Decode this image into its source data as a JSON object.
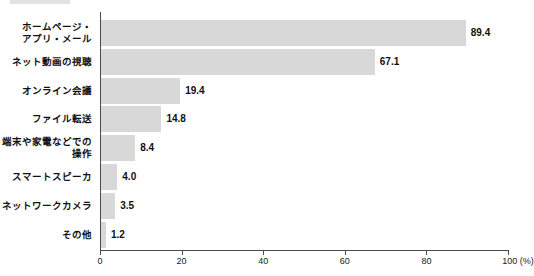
{
  "chart_data": {
    "type": "bar",
    "orientation": "horizontal",
    "title": "",
    "xlabel": "100 (%)",
    "ylabel": "",
    "xlim": [
      0,
      100
    ],
    "grid": false,
    "legend": null,
    "bar_color": "#d8d8d8",
    "axis_color": "#4a4a4a",
    "categories": [
      "ホームページ・\nアプリ・メール",
      "ネット動画の視聴",
      "オンライン会議",
      "ファイル転送",
      "端末や家電などでの\n操作",
      "スマートスピーカ",
      "ネットワークカメラ",
      "その他"
    ],
    "values": [
      89.4,
      67.1,
      19.4,
      14.8,
      8.4,
      4.0,
      3.5,
      1.2
    ],
    "value_labels": [
      "89.4",
      "67.1",
      "19.4",
      "14.8",
      "8.4",
      "4.0",
      "3.5",
      "1.2"
    ],
    "xticks": [
      0,
      20,
      40,
      60,
      80,
      100
    ],
    "xtick_labels": [
      "0",
      "20",
      "40",
      "60",
      "80",
      "100 (%)"
    ]
  }
}
